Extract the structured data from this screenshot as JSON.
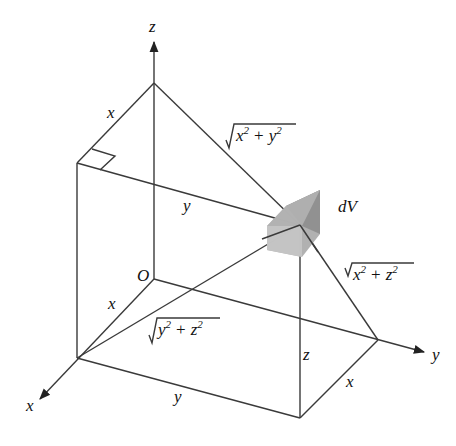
{
  "figure": {
    "axes": {
      "x_label": "x",
      "y_label": "y",
      "z_label": "z",
      "origin_label": "O"
    },
    "element_label": "dV",
    "edge_labels": {
      "top_x": "x",
      "top_y": "y",
      "base_x_left": "x",
      "base_y": "y",
      "base_x_right": "x",
      "height_z": "z"
    },
    "distance_labels": {
      "to_z_axis": {
        "radical": "x",
        "sup1": "2",
        "op": "+",
        "term2": "y",
        "sup2": "2"
      },
      "to_y_axis": {
        "radical": "x",
        "sup1": "2",
        "op": "+",
        "term2": "z",
        "sup2": "2"
      },
      "to_x_axis": {
        "radical": "y",
        "sup1": "2",
        "op": "+",
        "term2": "z",
        "sup2": "2"
      }
    },
    "colors": {
      "line": "#3a3a3a",
      "cube_light": "#c8c8c8",
      "cube_mid": "#a9a9a9",
      "cube_dark": "#8c8c8c"
    }
  }
}
